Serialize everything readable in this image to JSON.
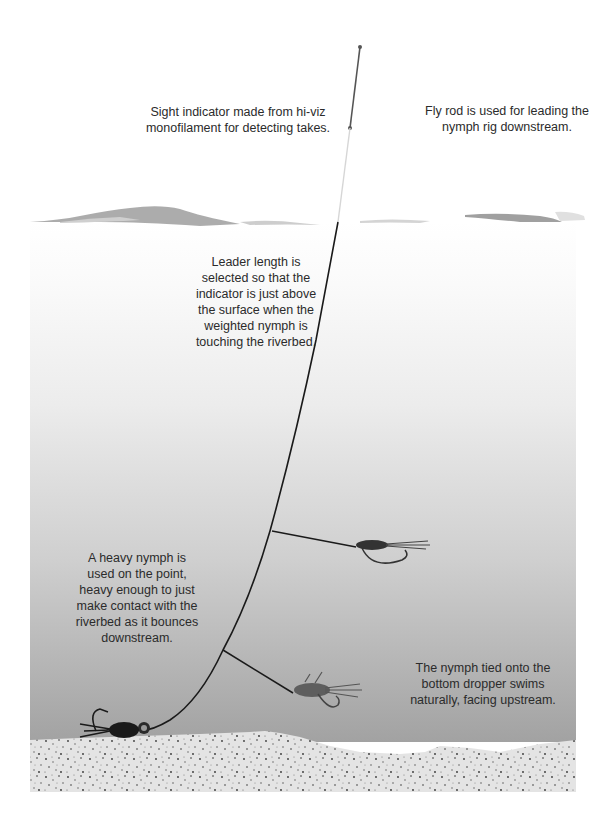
{
  "diagram": {
    "colors": {
      "background": "#ffffff",
      "water_top": "#ffffff",
      "water_bottom": "#9a9a9a",
      "riverbed": "#e6e6e6",
      "riverbed_speckle": "#3a3a3a",
      "surface_wave": "#a8a8a8",
      "line": "#1a1a1a",
      "indicator": "#d6d6d6",
      "rod": "#555555",
      "text": "#2b2b2b"
    },
    "annotations": {
      "sight_indicator": "Sight indicator made from hi-viz\nmonofilament for detecting takes.",
      "fly_rod": "Fly rod is used for leading the\nnymph rig downstream.",
      "leader_length": "Leader length is\nselected so that the\nindicator is just above\nthe surface when the\nweighted nymph is\ntouching the riverbed.",
      "heavy_nymph": "A heavy nymph is\nused on the point,\nheavy enough to just\nmake contact with the\nriverbed as it bounces\ndownstream.",
      "dropper_nymph": "The nymph tied onto the\nbottom dropper swims\nnaturally, facing upstream."
    },
    "elements": [
      {
        "name": "fly-rod-tip",
        "kind": "rod"
      },
      {
        "name": "sight-indicator",
        "kind": "monofilament"
      },
      {
        "name": "water-surface",
        "kind": "surface"
      },
      {
        "name": "leader-line",
        "kind": "line"
      },
      {
        "name": "upper-dropper-nymph",
        "kind": "fly"
      },
      {
        "name": "lower-dropper-nymph",
        "kind": "fly"
      },
      {
        "name": "point-nymph",
        "kind": "fly"
      },
      {
        "name": "riverbed",
        "kind": "gravel"
      }
    ]
  }
}
